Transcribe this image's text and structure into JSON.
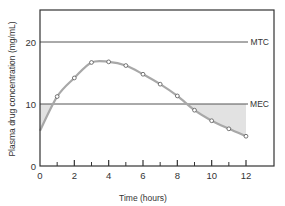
{
  "chart_data": {
    "type": "line",
    "title": "",
    "xlabel": "Time (hours)",
    "ylabel": "Plasma drug concentration (mg/mL)",
    "xlim": [
      0,
      13.5
    ],
    "ylim": [
      0,
      25
    ],
    "x_ticks": [
      0,
      2,
      4,
      6,
      8,
      10,
      12
    ],
    "x_minor_ticks": [
      1,
      3,
      5,
      7,
      9,
      11
    ],
    "y_ticks": [
      0,
      10,
      20
    ],
    "grid": false,
    "legend": null,
    "series": [
      {
        "name": "Plasma concentration",
        "x": [
          0,
          1,
          2,
          3,
          4,
          5,
          6,
          7,
          8,
          9,
          10,
          11,
          12
        ],
        "values": [
          5.7,
          11.2,
          14.2,
          16.7,
          16.8,
          16.2,
          14.8,
          13.2,
          11.3,
          9.0,
          7.3,
          6.0,
          4.8
        ],
        "markers_at": [
          1,
          2,
          3,
          4,
          5,
          6,
          7,
          8,
          9,
          10,
          11,
          12
        ],
        "color": "#a8a8a8"
      }
    ],
    "reference_lines": [
      {
        "label": "MTC",
        "value": 20
      },
      {
        "label": "MEC",
        "value": 10
      }
    ],
    "shaded_regions": [
      {
        "description": "Concentration below MEC at start",
        "x_range": [
          0,
          0.75
        ]
      },
      {
        "description": "Concentration below MEC at end",
        "x_range": [
          8.55,
          12
        ]
      }
    ]
  },
  "labels": {
    "x_axis": "Time (hours)",
    "y_axis": "Plasma drug concentration (mg/mL)",
    "mtc": "MTC",
    "mec": "MEC",
    "x_ticks": [
      "0",
      "2",
      "4",
      "6",
      "8",
      "10",
      "12"
    ],
    "y_ticks": [
      "0",
      "10",
      "20"
    ]
  },
  "colors": {
    "axis": "#333333",
    "curve": "#a8a8a8",
    "shade": "#e2e2e2",
    "reference_line": "#555555"
  }
}
